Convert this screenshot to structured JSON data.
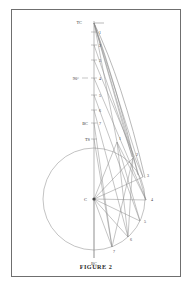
{
  "figure": {
    "caption": "FIGURE 2",
    "line_color": "#8a8a8a",
    "text_color": "#3a3a3a",
    "border_color": "#6f6f6f",
    "background": "#ffffff"
  },
  "labels": {
    "tangent_top": "TC",
    "right_angle": "90°",
    "begin_curve": "BC",
    "tangent_spiral": "TS",
    "center": "C",
    "bottom_chord": "BC"
  },
  "tangent_stations": [
    {
      "id": "1",
      "x": 82,
      "y": 22
    },
    {
      "id": "2",
      "x": 82,
      "y": 40
    },
    {
      "id": "3",
      "x": 82,
      "y": 59
    },
    {
      "id": "4",
      "x": 82,
      "y": 77
    },
    {
      "id": "5",
      "x": 82,
      "y": 95
    },
    {
      "id": "6",
      "x": 82,
      "y": 110
    },
    {
      "id": "7",
      "x": 82,
      "y": 122
    }
  ],
  "curve_points": [
    {
      "id": "1",
      "x": 112,
      "y": 140
    },
    {
      "id": "2",
      "x": 129,
      "y": 156
    },
    {
      "id": "3",
      "x": 139,
      "y": 175
    },
    {
      "id": "4",
      "x": 143,
      "y": 198
    },
    {
      "id": "5",
      "x": 136,
      "y": 219
    },
    {
      "id": "6",
      "x": 123,
      "y": 236
    },
    {
      "id": "7",
      "x": 106,
      "y": 246
    }
  ],
  "geometry": {
    "circle_center_x": 93,
    "circle_center_y": 198,
    "circle_radius": 51,
    "tangent_x": 93,
    "tangent_top_y": 20,
    "tangent_bottom_y": 249
  }
}
